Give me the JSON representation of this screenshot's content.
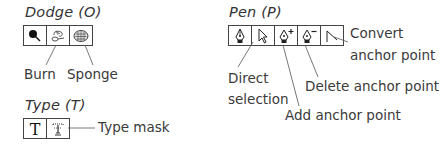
{
  "dodge": {
    "title": "Dodge (O)",
    "tools": [
      {
        "name": "dodge",
        "icon": "dodge-icon"
      },
      {
        "name": "burn",
        "icon": "burn-icon"
      },
      {
        "name": "sponge",
        "icon": "sponge-icon"
      }
    ],
    "labels": {
      "burn": "Burn",
      "sponge": "Sponge"
    }
  },
  "pen": {
    "title": "Pen (P)",
    "tools": [
      {
        "name": "pen",
        "icon": "pen-icon"
      },
      {
        "name": "direct-selection",
        "icon": "arrow-icon"
      },
      {
        "name": "add-anchor-point",
        "icon": "pen-plus-icon"
      },
      {
        "name": "delete-anchor-point",
        "icon": "pen-minus-icon"
      },
      {
        "name": "convert-anchor-point",
        "icon": "convert-icon"
      }
    ],
    "labels": {
      "convert_line1": "Convert",
      "convert_line2": "anchor point",
      "direct_line1": "Direct",
      "direct_line2": "selection",
      "delete": "Delete anchor point",
      "add": "Add anchor point"
    }
  },
  "type": {
    "title": "Type (T)",
    "tools": [
      {
        "name": "type",
        "icon": "type-icon"
      },
      {
        "name": "type-mask",
        "icon": "type-mask-icon"
      }
    ],
    "labels": {
      "type_mask": "Type mask"
    }
  }
}
